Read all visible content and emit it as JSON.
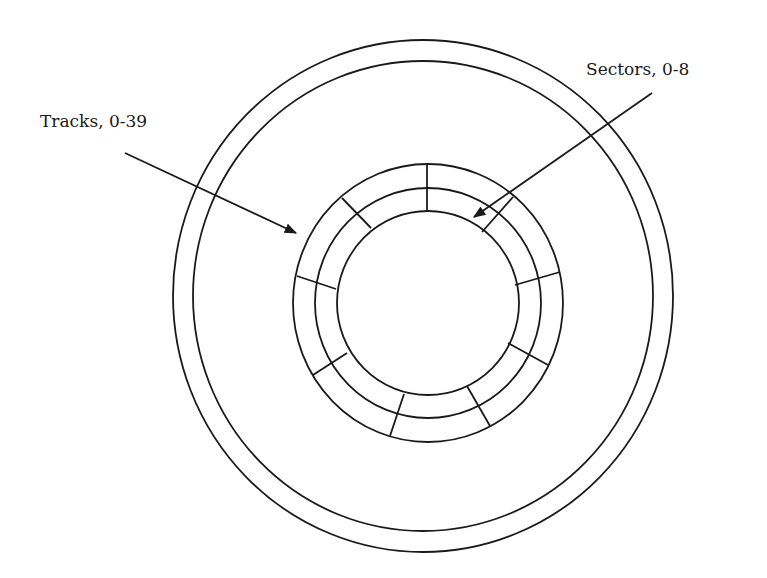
{
  "diagram": {
    "colors": {
      "line": "#1a1a1a",
      "background": "#ffffff"
    },
    "labels": {
      "tracks": "Tracks, 0-39",
      "sectors": "Sectors, 0-8"
    },
    "disk": {
      "outer_rings": [
        {
          "name": "disk-edge-outer",
          "cx": 423,
          "cy": 296,
          "rx": 250,
          "ry": 256
        },
        {
          "name": "disk-edge-inner",
          "cx": 423,
          "cy": 296,
          "rx": 230,
          "ry": 235
        }
      ],
      "track_rings": [
        {
          "name": "track-ring-outer",
          "cx": 428,
          "cy": 303,
          "rx": 135,
          "ry": 139
        },
        {
          "name": "track-ring-middle",
          "cx": 428,
          "cy": 303,
          "rx": 113,
          "ry": 115
        },
        {
          "name": "track-ring-inner",
          "cx": 428,
          "cy": 303,
          "rx": 91,
          "ry": 92
        }
      ],
      "sector_count": 9,
      "sector_dividers": [
        {
          "x1": 427,
          "y1": 164,
          "x2": 427,
          "y2": 211
        },
        {
          "x1": 342,
          "y1": 198,
          "x2": 371,
          "y2": 228
        },
        {
          "x1": 297,
          "y1": 276,
          "x2": 336,
          "y2": 289
        },
        {
          "x1": 313,
          "y1": 375,
          "x2": 347,
          "y2": 353
        },
        {
          "x1": 390,
          "y1": 436,
          "x2": 404,
          "y2": 394
        },
        {
          "x1": 490,
          "y1": 426,
          "x2": 467,
          "y2": 386
        },
        {
          "x1": 548,
          "y1": 365,
          "x2": 508,
          "y2": 343
        },
        {
          "x1": 560,
          "y1": 272,
          "x2": 515,
          "y2": 285
        },
        {
          "x1": 513,
          "y1": 197,
          "x2": 482,
          "y2": 232
        }
      ]
    },
    "arrows": {
      "tracks": {
        "x1": 125,
        "y1": 153,
        "x2": 296,
        "y2": 233
      },
      "sectors": {
        "x1": 652,
        "y1": 93,
        "x2": 474,
        "y2": 217
      }
    }
  }
}
